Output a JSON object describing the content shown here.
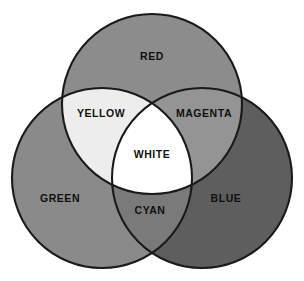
{
  "diagram": {
    "title": "Additive Color Mixing Venn Diagram",
    "background_color": "#ffffff",
    "outline_color": "#1a1a1a",
    "outline_width": 2.1,
    "canvas": {
      "width": 304,
      "height": 281
    }
  },
  "chart_data": {
    "type": "diagram",
    "subtype": "venn-3-circle",
    "title": "Additive Color Mixing Venn Diagram",
    "grid": false,
    "legend": "none",
    "circles": [
      {
        "id": "red",
        "label": "RED",
        "cx": 152,
        "cy": 104,
        "r": 90,
        "fill": "#8c8c8c"
      },
      {
        "id": "green",
        "label": "GREEN",
        "cx": 102,
        "cy": 178,
        "r": 90,
        "fill": "#8a8a8a"
      },
      {
        "id": "blue",
        "label": "BLUE",
        "cx": 202,
        "cy": 178,
        "r": 90,
        "fill": "#5e5e5e"
      }
    ],
    "regions": [
      {
        "id": "red",
        "label": "RED",
        "members": [
          "red"
        ],
        "fill": "#8c8c8c",
        "label_x": 152,
        "label_y": 57
      },
      {
        "id": "green",
        "label": "GREEN",
        "members": [
          "green"
        ],
        "fill": "#8a8a8a",
        "label_x": 60,
        "label_y": 199
      },
      {
        "id": "blue",
        "label": "BLUE",
        "members": [
          "blue"
        ],
        "fill": "#5e5e5e",
        "label_x": 226,
        "label_y": 199
      },
      {
        "id": "yellow",
        "label": "YELLOW",
        "members": [
          "red",
          "green"
        ],
        "fill": "#ededed",
        "label_x": 101,
        "label_y": 114
      },
      {
        "id": "magenta",
        "label": "MAGENTA",
        "members": [
          "red",
          "blue"
        ],
        "fill": "#949494",
        "label_x": 204,
        "label_y": 114
      },
      {
        "id": "cyan",
        "label": "CYAN",
        "members": [
          "green",
          "blue"
        ],
        "fill": "#7a7a7a",
        "label_x": 150,
        "label_y": 211
      },
      {
        "id": "white",
        "label": "WHITE",
        "members": [
          "red",
          "green",
          "blue"
        ],
        "fill": "#ffffff",
        "label_x": 152,
        "label_y": 155
      }
    ]
  }
}
